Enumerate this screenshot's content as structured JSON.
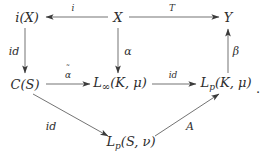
{
  "figure": {
    "type": "commutative-diagram",
    "width": 264,
    "height": 166,
    "background": "#ffffff",
    "ink_color": "#2d2d2d",
    "trailing_punctuation": "."
  },
  "nodes": [
    {
      "id": "iX",
      "label": "i(X)",
      "base": "i(X)",
      "x": 27,
      "y": 17
    },
    {
      "id": "X",
      "label": "X",
      "base": "X",
      "x": 118,
      "y": 17
    },
    {
      "id": "Y",
      "label": "Y",
      "base": "Y",
      "x": 228,
      "y": 17
    },
    {
      "id": "CS",
      "label": "C(S)",
      "base": "C(S)",
      "x": 25,
      "y": 84
    },
    {
      "id": "Linf",
      "label": "L∞(K, μ)",
      "base": "L",
      "sub": "∞",
      "tail": "(K, μ)",
      "x": 120,
      "y": 84
    },
    {
      "id": "LpK",
      "label": "Lp(K, μ)",
      "base": "L",
      "sub": "p",
      "tail": "(K, μ)",
      "x": 226,
      "y": 84
    },
    {
      "id": "LpS",
      "label": "Lp(S, ν)",
      "base": "L",
      "sub": "p",
      "tail": "(S, ν)",
      "x": 131,
      "y": 143
    }
  ],
  "arrows": [
    {
      "id": "X-to-iX",
      "from": "X",
      "to": "iX",
      "label": "i",
      "direction": "left",
      "label_x": 73,
      "label_y": 8
    },
    {
      "id": "X-to-Y",
      "from": "X",
      "to": "Y",
      "label": "T",
      "direction": "right",
      "label_x": 172,
      "label_y": 8
    },
    {
      "id": "iX-to-CS",
      "from": "iX",
      "to": "CS",
      "label": "id",
      "direction": "down",
      "label_x": 14,
      "label_y": 51
    },
    {
      "id": "X-to-Linf",
      "from": "X",
      "to": "Linf",
      "label": "α",
      "direction": "down",
      "label_x": 128,
      "label_y": 51
    },
    {
      "id": "LpK-to-Y",
      "from": "LpK",
      "to": "Y",
      "label": "β",
      "direction": "up",
      "label_x": 236,
      "label_y": 51
    },
    {
      "id": "CS-to-Linf",
      "from": "CS",
      "to": "Linf",
      "label": "α̃",
      "direction": "right",
      "label_x": 68,
      "label_y": 75
    },
    {
      "id": "Linf-to-LpK",
      "from": "Linf",
      "to": "LpK",
      "label": "id",
      "direction": "right",
      "label_x": 173,
      "label_y": 75
    },
    {
      "id": "CS-to-LpS",
      "from": "CS",
      "to": "LpS",
      "label": "id",
      "direction": "down-right",
      "label_x": 51,
      "label_y": 126
    },
    {
      "id": "LpS-to-LpK",
      "from": "LpS",
      "to": "LpK",
      "label": "A",
      "direction": "up-right",
      "label_x": 190,
      "label_y": 126
    }
  ],
  "labels": {
    "i": "i",
    "T": "T",
    "alpha": "α",
    "beta": "β",
    "alpha_tilde_base": "α",
    "alpha_tilde_accent": "˜",
    "A": "A",
    "id_left": "id",
    "id_middle": "id",
    "id_diagonal": "id"
  }
}
